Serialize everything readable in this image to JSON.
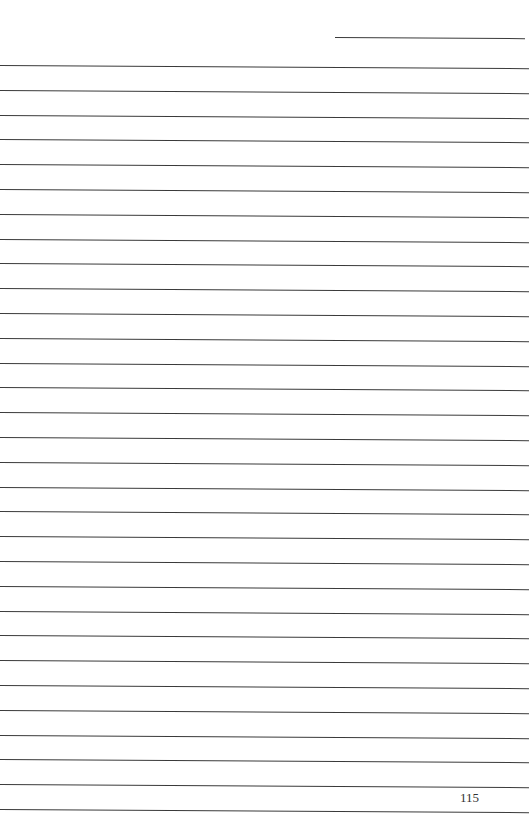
{
  "page": {
    "type": "lined-notebook-page",
    "page_number": "115",
    "line_count": 31,
    "header_line": true
  }
}
